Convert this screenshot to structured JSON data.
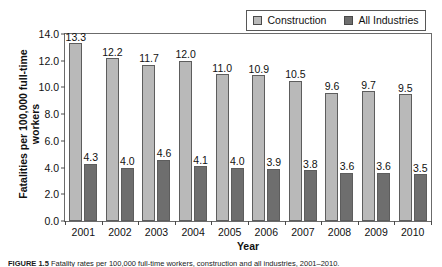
{
  "figure": {
    "caption_label": "FIGURE 1.5",
    "caption_text": "Fatality rates per 100,000 full-time workers, construction and all industries, 2001–2010."
  },
  "legend": {
    "entries": [
      {
        "label": "Construction",
        "color": "#b9b9b9",
        "swatch_name": "construction-swatch"
      },
      {
        "label": "All Industries",
        "color": "#6e6e6e",
        "swatch_name": "all-industries-swatch"
      }
    ]
  },
  "axes": {
    "ylabel_line1": "Fatalities per 100,000 full-time",
    "ylabel_line2": "workers",
    "xlabel": "Year",
    "yticks": [
      "0.0",
      "2.0",
      "4.0",
      "6.0",
      "8.0",
      "10.0",
      "12.0",
      "14.0"
    ]
  },
  "chart_data": {
    "type": "bar",
    "title": "",
    "xlabel": "Year",
    "ylabel": "Fatalities per 100,000 full-time workers",
    "ylim": [
      0,
      14
    ],
    "ytick_step": 2,
    "grid": false,
    "legend_position": "top-right",
    "categories": [
      "2001",
      "2002",
      "2003",
      "2004",
      "2005",
      "2006",
      "2007",
      "2008",
      "2009",
      "2010"
    ],
    "series": [
      {
        "name": "Construction",
        "color": "#b9b9b9",
        "values": [
          13.3,
          12.2,
          11.7,
          12.0,
          11.0,
          10.9,
          10.5,
          9.6,
          9.7,
          9.5
        ],
        "labels": [
          "13.3",
          "12.2",
          "11.7",
          "12.0",
          "11.0",
          "10.9",
          "10.5",
          "9.6",
          "9.7",
          "9.5"
        ]
      },
      {
        "name": "All Industries",
        "color": "#6e6e6e",
        "values": [
          4.3,
          4.0,
          4.6,
          4.1,
          4.0,
          3.9,
          3.8,
          3.6,
          3.6,
          3.5
        ],
        "labels": [
          "4.3",
          "4.0",
          "4.6",
          "4.1",
          "4.0",
          "3.9",
          "3.8",
          "3.6",
          "3.6",
          "3.5"
        ]
      }
    ]
  }
}
